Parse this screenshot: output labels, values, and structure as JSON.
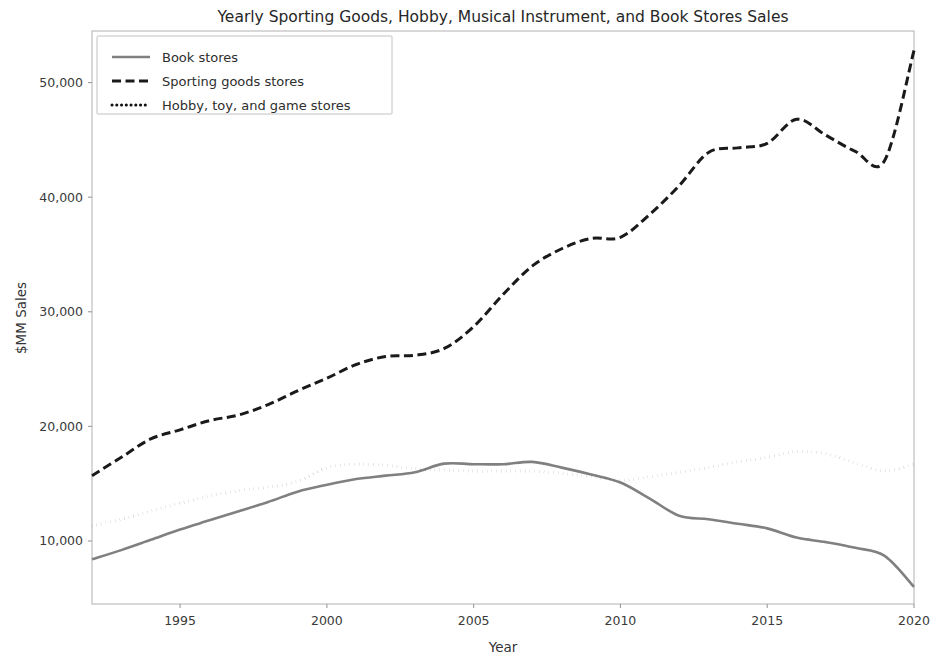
{
  "chart_data": {
    "type": "line",
    "title": "Yearly Sporting Goods, Hobby, Musical Instrument, and Book Stores Sales",
    "xlabel": "Year",
    "ylabel": "$MM Sales",
    "xlim": [
      1992,
      2020
    ],
    "ylim": [
      4500,
      54500
    ],
    "grid": false,
    "legend_position": "upper left",
    "x": [
      1992,
      1993,
      1994,
      1995,
      1996,
      1997,
      1998,
      1999,
      2000,
      2001,
      2002,
      2003,
      2004,
      2005,
      2006,
      2007,
      2008,
      2009,
      2010,
      2011,
      2012,
      2013,
      2014,
      2015,
      2016,
      2017,
      2018,
      2019,
      2020
    ],
    "xticks": [
      1995,
      2000,
      2005,
      2010,
      2015,
      2020
    ],
    "xtick_labels": [
      "1995",
      "2000",
      "2005",
      "2010",
      "2015",
      "2020"
    ],
    "yticks": [
      10000,
      20000,
      30000,
      40000,
      50000
    ],
    "ytick_labels": [
      "10,000",
      "20,000",
      "30,000",
      "40,000",
      "50,000"
    ],
    "series": [
      {
        "name": "Book stores",
        "style": "solid",
        "color": "#808080",
        "width": 2.6,
        "values": [
          8400,
          9200,
          10100,
          11000,
          11800,
          12600,
          13400,
          14300,
          14900,
          15400,
          15700,
          16000,
          16750,
          16700,
          16700,
          16900,
          16400,
          15800,
          15100,
          13700,
          12200,
          11900,
          11500,
          11100,
          10300,
          9900,
          9400,
          8700,
          6000
        ]
      },
      {
        "name": "Sporting goods stores",
        "style": "dashed",
        "color": "#1a1a1a",
        "width": 3.0,
        "values": [
          15700,
          17300,
          18900,
          19700,
          20500,
          21000,
          21900,
          23100,
          24200,
          25400,
          26100,
          26200,
          26800,
          28700,
          31500,
          34000,
          35500,
          36400,
          36500,
          38500,
          41000,
          43900,
          44300,
          44700,
          46800,
          45400,
          44000,
          43200,
          52800
        ]
      },
      {
        "name": "Hobby, toy, and game stores",
        "style": "dotted",
        "color": "#111111",
        "width": 3.0,
        "values": [
          11300,
          11900,
          12600,
          13300,
          13900,
          14400,
          14700,
          15200,
          16400,
          16700,
          16600,
          16300,
          16200,
          16100,
          16100,
          16100,
          15900,
          15600,
          15300,
          15600,
          16000,
          16400,
          16900,
          17300,
          17800,
          17600,
          16800,
          16100,
          16700
        ]
      }
    ]
  }
}
